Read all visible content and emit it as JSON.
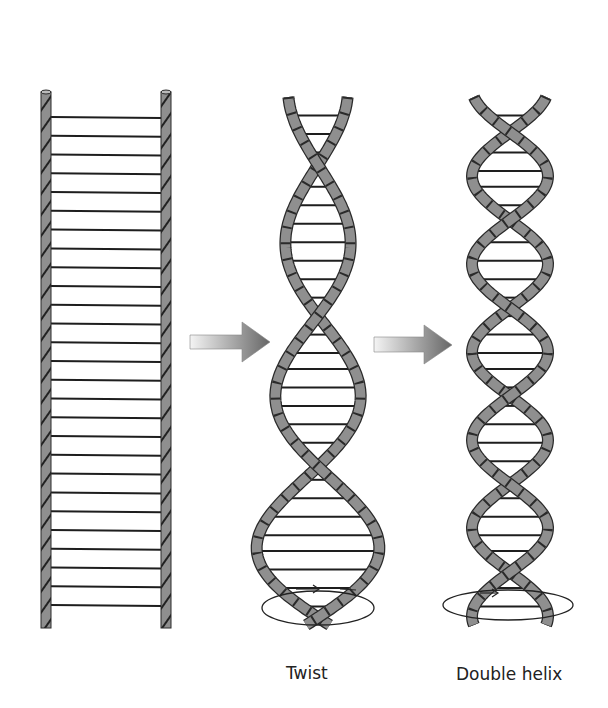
{
  "figure": {
    "panels": [
      {
        "id": "ladder",
        "label": ""
      },
      {
        "id": "twist",
        "label": "Twist"
      },
      {
        "id": "double_helix",
        "label": "Double helix"
      }
    ],
    "arrows": [
      {
        "from": "ladder",
        "to": "twist"
      },
      {
        "from": "twist",
        "to": "double_helix"
      }
    ],
    "colors": {
      "strand_fill": "#8f8f8f",
      "strand_stroke": "#2a2a2a",
      "rung": "#1e1e1e",
      "arrow_light": "#f2f2f2",
      "arrow_dark": "#6f6f6f",
      "background": "#ffffff"
    },
    "ladder": {
      "left_x": 46,
      "right_x": 166,
      "top_y": 92,
      "bottom_y": 628,
      "rung_count": 27
    }
  }
}
